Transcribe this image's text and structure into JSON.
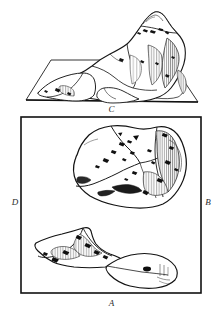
{
  "figure": {
    "background_color": "#ffffff",
    "ink_color": "#1a1a1a",
    "panels": [
      {
        "id": "perspective",
        "label": "C",
        "kind": "perspective-block-diagram",
        "description": "Oblique view of a flat quadrilateral base plane carrying a raised, ridged landmass that rises to a peak at the upper right."
      },
      {
        "id": "plan",
        "label_left": "D",
        "label_right": "B",
        "label_bottom": "A",
        "kind": "plan-map",
        "description": "Rectangular framed plan view containing three islands: a large central landmass with hatched relief, a smaller arrow-shaped island lower left, and a leaf-shaped island lower right."
      }
    ],
    "labels": {
      "top_panel": "C",
      "left_edge": "D",
      "right_edge": "B",
      "bottom": "A"
    },
    "landmasses": [
      {
        "name": "main-landmass",
        "position": "center",
        "relief": "vertical hatching on eastern flank, ridge blobs in interior"
      },
      {
        "name": "western-island",
        "position": "lower-left",
        "relief": "hatched spur with dark crest"
      },
      {
        "name": "eastern-island",
        "position": "lower-right",
        "relief": "smooth leaf outline with small dark vent"
      }
    ]
  }
}
